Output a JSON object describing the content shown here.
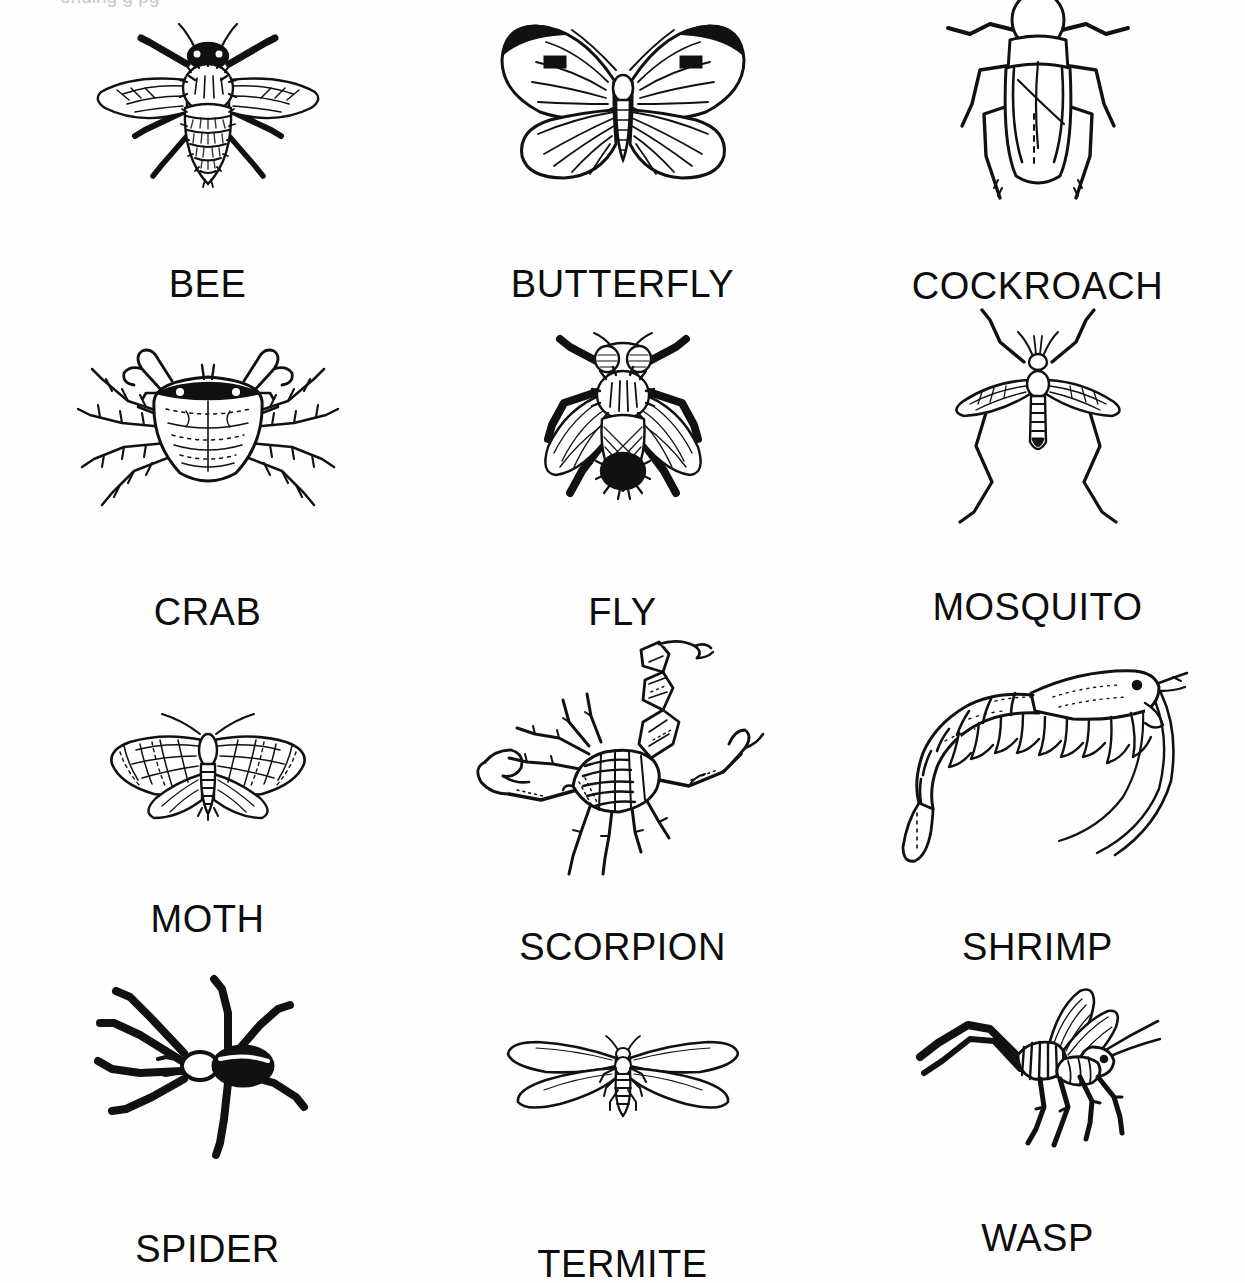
{
  "page": {
    "background_color": "#fefefe",
    "ink_color": "#0d0d0d",
    "top_bleed_text": "ending  g    pg",
    "columns": 3,
    "rows": 4
  },
  "items": [
    {
      "id": "bee",
      "label": "BEE",
      "icon": "bee-illustration",
      "row": 1,
      "col": 1
    },
    {
      "id": "butterfly",
      "label": "BUTTERFLY",
      "icon": "butterfly-illustration",
      "row": 1,
      "col": 2
    },
    {
      "id": "cockroach",
      "label": "COCKROACH",
      "icon": "cockroach-illustration",
      "row": 1,
      "col": 3
    },
    {
      "id": "crab",
      "label": "CRAB",
      "icon": "crab-illustration",
      "row": 2,
      "col": 1
    },
    {
      "id": "fly",
      "label": "FLY",
      "icon": "fly-illustration",
      "row": 2,
      "col": 2
    },
    {
      "id": "mosquito",
      "label": "MOSQUITO",
      "icon": "mosquito-illustration",
      "row": 2,
      "col": 3
    },
    {
      "id": "moth",
      "label": "MOTH",
      "icon": "moth-illustration",
      "row": 3,
      "col": 1
    },
    {
      "id": "scorpion",
      "label": "SCORPION",
      "icon": "scorpion-illustration",
      "row": 3,
      "col": 2
    },
    {
      "id": "shrimp",
      "label": "SHRIMP",
      "icon": "shrimp-illustration",
      "row": 3,
      "col": 3
    },
    {
      "id": "spider",
      "label": "SPIDER",
      "icon": "spider-illustration",
      "row": 4,
      "col": 1
    },
    {
      "id": "termite",
      "label": "TERMITE",
      "icon": "termite-illustration",
      "row": 4,
      "col": 2
    },
    {
      "id": "wasp",
      "label": "WASP",
      "icon": "wasp-illustration",
      "row": 4,
      "col": 3
    }
  ]
}
